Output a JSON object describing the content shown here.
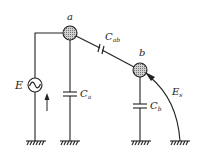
{
  "diagram": {
    "type": "circuit",
    "nodes": [
      {
        "id": "a",
        "label": "a"
      },
      {
        "id": "b",
        "label": "b"
      }
    ],
    "source": {
      "label": "E",
      "symbol": "ac-source"
    },
    "capacitors": [
      {
        "label": "C",
        "subscript": "a"
      },
      {
        "label": "C",
        "subscript": "ab"
      },
      {
        "label": "C",
        "subscript": "b"
      }
    ],
    "external_field": {
      "label": "E",
      "subscript": "s"
    },
    "colors": {
      "line": "#222222",
      "node_fill": "#aaaaaa",
      "background": "#ffffff"
    }
  }
}
